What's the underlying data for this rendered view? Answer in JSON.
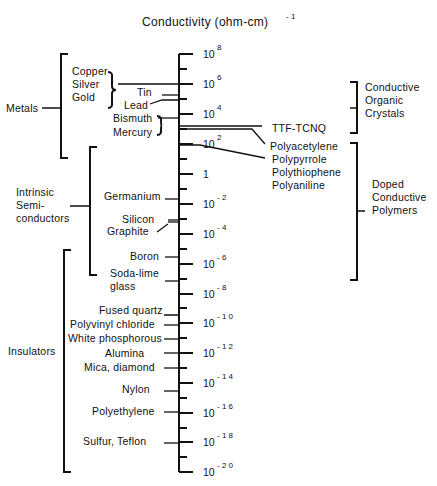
{
  "title": {
    "text": "Conductivity  (ohm-cm)",
    "exponent": "- 1"
  },
  "axis": {
    "x": 179,
    "y_top": 54,
    "y_bottom": 472,
    "major_ticks": [
      {
        "base": "10",
        "exp": "8",
        "y": 54
      },
      {
        "base": "10",
        "exp": "6",
        "y": 84
      },
      {
        "base": "10",
        "exp": "4",
        "y": 114
      },
      {
        "base": "10",
        "exp": "2",
        "y": 144
      },
      {
        "base": "1",
        "exp": "",
        "y": 174
      },
      {
        "base": "10",
        "exp": "- 2",
        "y": 204
      },
      {
        "base": "10",
        "exp": "- 4",
        "y": 234
      },
      {
        "base": "10",
        "exp": "- 6",
        "y": 264
      },
      {
        "base": "10",
        "exp": "- 8",
        "y": 294
      },
      {
        "base": "10",
        "exp": "- 1 0",
        "y": 323
      },
      {
        "base": "10",
        "exp": "- 1 2",
        "y": 353
      },
      {
        "base": "10",
        "exp": "- 1 4",
        "y": 383
      },
      {
        "base": "10",
        "exp": "- 1 6",
        "y": 413
      },
      {
        "base": "10",
        "exp": "- 1 8",
        "y": 442
      },
      {
        "base": "10",
        "exp": "- 2 0",
        "y": 472
      }
    ],
    "minor_ticks_y": [
      69,
      99,
      129,
      159,
      189,
      219,
      249,
      279,
      308,
      338,
      368,
      398,
      428,
      457
    ]
  },
  "categories": [
    {
      "name": "Metals",
      "lines": [
        "Metals"
      ],
      "side": "left",
      "bracket_x": 61,
      "y1": 54,
      "y2": 158,
      "label_x": 6,
      "label_y": 112
    },
    {
      "name": "Intrinsic Semiconductors",
      "lines": [
        "Intrinsic",
        "Semi-",
        "conductors"
      ],
      "side": "left",
      "bracket_x": 90,
      "y1": 147,
      "y2": 275,
      "label_x": 16,
      "label_y": 196
    },
    {
      "name": "Insulators",
      "lines": [
        "Insulators"
      ],
      "side": "left",
      "bracket_x": 64,
      "y1": 250,
      "y2": 472,
      "label_x": 8,
      "label_y": 355
    },
    {
      "name": "Conductive Organic Crystals",
      "lines": [
        "Conductive",
        "Organic",
        "Crystals"
      ],
      "side": "right",
      "bracket_x": 357,
      "y1": 82,
      "y2": 133,
      "label_x": 365,
      "label_y": 91
    },
    {
      "name": "Doped Conductive Polymers",
      "lines": [
        "Doped",
        "Conductive",
        "Polymers"
      ],
      "side": "right",
      "bracket_x": 357,
      "y1": 143,
      "y2": 280,
      "label_x": 372,
      "label_y": 188
    }
  ],
  "materials": [
    {
      "name": "Copper",
      "x": 72,
      "y": 75
    },
    {
      "name": "Silver",
      "x": 72,
      "y": 88
    },
    {
      "name": "Gold",
      "x": 72,
      "y": 101
    },
    {
      "name": "Tin",
      "x": 137,
      "y": 96
    },
    {
      "name": "Lead",
      "x": 124,
      "y": 109
    },
    {
      "name": "Bismuth",
      "x": 113,
      "y": 122
    },
    {
      "name": "Mercury",
      "x": 113,
      "y": 136
    },
    {
      "name": "TTF-TCNQ",
      "x": 272,
      "y": 132
    },
    {
      "name": "Polyacetylene",
      "x": 270,
      "y": 150
    },
    {
      "name": "Polypyrrole",
      "x": 272,
      "y": 163
    },
    {
      "name": "Polythiophene",
      "x": 272,
      "y": 176
    },
    {
      "name": "Polyaniline",
      "x": 272,
      "y": 189
    },
    {
      "name": "Germanium",
      "x": 104,
      "y": 200
    },
    {
      "name": "Silicon",
      "x": 122,
      "y": 223
    },
    {
      "name": "Graphite",
      "x": 107,
      "y": 235
    },
    {
      "name": "Boron",
      "x": 130,
      "y": 260
    },
    {
      "name": "Soda-lime",
      "x": 110,
      "y": 277
    },
    {
      "name": "glass",
      "x": 110,
      "y": 290
    },
    {
      "name": "Fused quartz",
      "x": 99,
      "y": 314
    },
    {
      "name": "Polyvinyl chloride",
      "x": 70,
      "y": 328
    },
    {
      "name": "White phosphorous",
      "x": 68,
      "y": 342
    },
    {
      "name": "Alumina",
      "x": 105,
      "y": 357
    },
    {
      "name": "Mica, diamond",
      "x": 84,
      "y": 371
    },
    {
      "name": "Nylon",
      "x": 122,
      "y": 393
    },
    {
      "name": "Polyethylene",
      "x": 92,
      "y": 415
    },
    {
      "name": "Sulfur,  Teflon",
      "x": 83,
      "y": 445
    }
  ],
  "connectors": [
    "M118,84 L179,84",
    "M162,95 L179,95",
    "M150,104 L162,100 L179,100",
    "M158,118 L179,118",
    "M179,126 L262,126",
    "M179,129 L252,129 L265,144",
    "M179,145 L200,145 L265,158",
    "M165,199 L179,199",
    "M168,220 L179,220",
    "M168,222 L179,222",
    "M157,232 L168,224",
    "M165,257 L179,257",
    "M165,281 L179,281",
    "M164,315 L179,315 L179,309",
    "M164,325 L179,325",
    "M164,339 L179,339",
    "M164,353 L179,353",
    "M164,368 L179,368",
    "M164,391 L179,391",
    "M164,412 L179,412",
    "M164,443 L179,443"
  ],
  "braces": [
    {
      "x": 108,
      "y1": 72,
      "y2": 108,
      "tip": 116
    },
    {
      "x": 157,
      "y1": 116,
      "y2": 135,
      "tip": 162
    }
  ],
  "category_stubs": [
    {
      "x1": 42,
      "y1": 108,
      "x2": 61,
      "y2": 108
    },
    {
      "x1": 70,
      "y1": 206,
      "x2": 90,
      "y2": 206
    },
    {
      "x1": 350,
      "y1": 108,
      "x2": 357,
      "y2": 108
    },
    {
      "x1": 357,
      "y1": 211,
      "x2": 365,
      "y2": 211
    }
  ]
}
